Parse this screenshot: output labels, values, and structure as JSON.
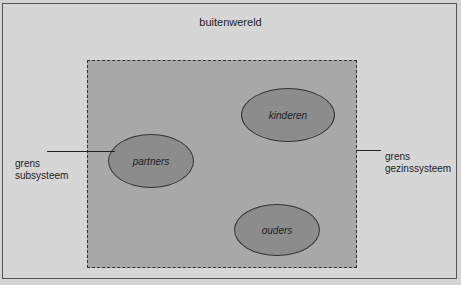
{
  "diagram": {
    "outer_label": "buitenwereld",
    "nodes": [
      {
        "id": "kinderen",
        "label": "kinderen"
      },
      {
        "id": "partners",
        "label": "partners"
      },
      {
        "id": "ouders",
        "label": "ouders"
      }
    ],
    "left_annotation": {
      "line1": "grens",
      "line2": "subsysteem"
    },
    "right_annotation": {
      "line1": "grens",
      "line2": "gezinssysteem"
    }
  }
}
